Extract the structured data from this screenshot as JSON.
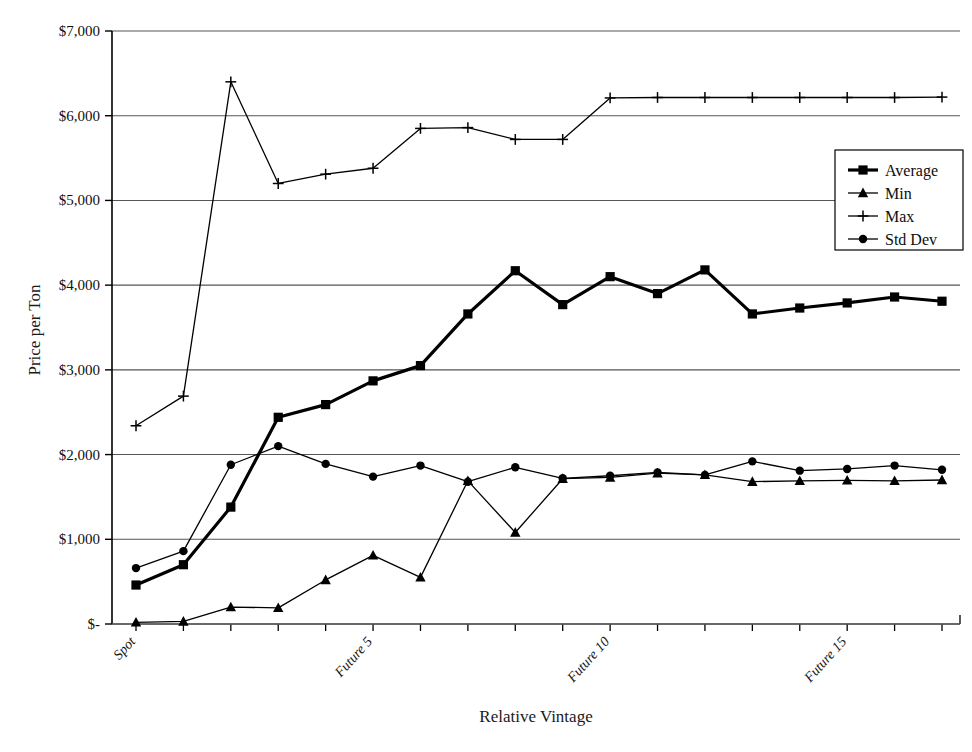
{
  "chart_data": {
    "type": "line",
    "title": "",
    "xlabel": "Relative Vintage",
    "ylabel": "Price per Ton",
    "ylim": [
      0,
      7000
    ],
    "ytick_labels": [
      "$7,000",
      "$6,000",
      "$5,000",
      "$4,000",
      "$3,000",
      "$2,000",
      "$1,000",
      "$-"
    ],
    "ytick_values": [
      7000,
      6000,
      5000,
      4000,
      3000,
      2000,
      1000,
      0
    ],
    "grid": true,
    "legend_position": "right-upper",
    "x_index": [
      0,
      1,
      2,
      3,
      4,
      5,
      6,
      7,
      8,
      9,
      10,
      11,
      12,
      13,
      14,
      15,
      16,
      17
    ],
    "xtick_labeled": [
      {
        "index": 0,
        "label": "Spot"
      },
      {
        "index": 5,
        "label": "Future 5"
      },
      {
        "index": 10,
        "label": "Future 10"
      },
      {
        "index": 15,
        "label": "Future 15"
      }
    ],
    "series": [
      {
        "name": "Average",
        "marker": "square",
        "line_width": 3.2,
        "values": [
          460,
          700,
          1380,
          2440,
          2590,
          2870,
          3050,
          3660,
          4170,
          3770,
          4100,
          3900,
          4180,
          3660,
          3730,
          3790,
          3860,
          3810
        ]
      },
      {
        "name": "Min",
        "marker": "triangle",
        "line_width": 1.3,
        "values": [
          20,
          30,
          200,
          190,
          520,
          810,
          550,
          1690,
          1080,
          1715,
          1730,
          1780,
          1760,
          1680,
          1690,
          1695,
          1690,
          1700
        ]
      },
      {
        "name": "Max",
        "marker": "plus",
        "line_width": 1.3,
        "values": [
          2340,
          2690,
          6400,
          5200,
          5310,
          5380,
          5850,
          5860,
          5720,
          5720,
          6210,
          6215,
          6215,
          6215,
          6215,
          6215,
          6215,
          6220
        ]
      },
      {
        "name": "Std Dev",
        "marker": "circle",
        "line_width": 1.3,
        "values": [
          660,
          860,
          1880,
          2100,
          1890,
          1740,
          1870,
          1680,
          1850,
          1720,
          1750,
          1790,
          1760,
          1920,
          1810,
          1830,
          1870,
          1820
        ]
      }
    ]
  },
  "legend": {
    "entries": [
      {
        "label": "Average"
      },
      {
        "label": "Min"
      },
      {
        "label": "Max"
      },
      {
        "label": "Std Dev"
      }
    ]
  },
  "colors": {
    "line": "#000000",
    "grid": "#555555",
    "axis": "#000000",
    "background": "#ffffff"
  }
}
